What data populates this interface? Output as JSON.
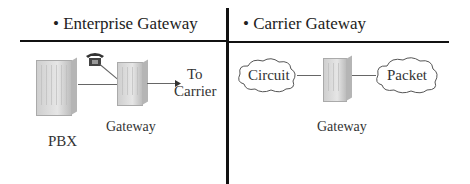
{
  "left_panel": {
    "title": "• Enterprise Gateway",
    "pbx_label": "PBX",
    "gateway_label": "Gateway",
    "arrow_label_line1": "To",
    "arrow_label_line2": "Carrier",
    "phone_icon": "telephone-icon"
  },
  "right_panel": {
    "title": "• Carrier Gateway",
    "cloud_left_label": "Circuit",
    "cloud_right_label": "Packet",
    "gateway_label": "Gateway"
  },
  "colors": {
    "divider": "#111111",
    "equipment": "#d4d4d4",
    "text": "#222222"
  }
}
